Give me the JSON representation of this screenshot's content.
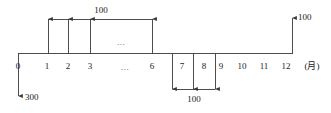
{
  "diagram": {
    "type": "cash-flow-timeline",
    "axis": {
      "unit_label": "(月)",
      "tick_labels": [
        "0",
        "1",
        "2",
        "3",
        "...",
        "6",
        "7",
        "8",
        "9",
        "10",
        "11",
        "12"
      ],
      "ellipsis_above_axis": "..."
    },
    "flows": [
      {
        "id": "initial-outflow",
        "direction": "down",
        "period": "0",
        "amount": "300"
      },
      {
        "id": "inflow-series-1-6",
        "direction": "up",
        "periods": "1-6",
        "amount": "100"
      },
      {
        "id": "outflow-series-7-9",
        "direction": "down",
        "periods": "7-9",
        "amount": "100"
      },
      {
        "id": "inflow-12",
        "direction": "up",
        "period": "12",
        "amount": "100"
      }
    ],
    "annotations": {
      "top_bracket_amount": "100",
      "bottom_bracket_amount": "100",
      "end_arrow_amount": "100",
      "start_arrow_amount": "300"
    },
    "colors": {
      "line": "#3a3a3a",
      "text": "#1a1a1a",
      "background": "#ffffff"
    }
  }
}
